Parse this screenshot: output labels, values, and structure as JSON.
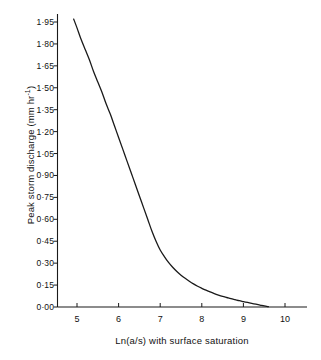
{
  "chart_data": {
    "type": "line",
    "title": "",
    "subtitle": "",
    "xlabel": "Ln(a/s) with surface saturation",
    "ylabel_text": "Peak storm discharge (mm hr",
    "ylabel_exponent": "-1",
    "ylabel_tail": ")",
    "ylabel_full": "Peak storm discharge (mm hr^-1)",
    "xlim": [
      4.55,
      10.45
    ],
    "ylim": [
      0.0,
      2.0
    ],
    "grid": false,
    "legend": null,
    "annotations": [],
    "xticks": [
      5,
      6,
      7,
      8,
      9,
      10
    ],
    "xtick_labels": [
      "5",
      "6",
      "7",
      "8",
      "9",
      "10"
    ],
    "yticks": [
      0.0,
      0.15,
      0.3,
      0.45,
      0.6,
      0.75,
      0.9,
      1.05,
      1.2,
      1.35,
      1.5,
      1.65,
      1.8,
      1.95
    ],
    "ytick_labels": [
      "0·00",
      "0·15",
      "0·30",
      "0·45",
      "0·60",
      "0·75",
      "0·90",
      "1·05",
      "1·20",
      "1·35",
      "1·50",
      "1·65",
      "1·80",
      "1·95"
    ],
    "series": [
      {
        "name": "Peak storm discharge",
        "color": "#1a1a1a",
        "linewidth": 1.3,
        "x": [
          4.92,
          5.0,
          5.1,
          5.2,
          5.3,
          5.4,
          5.5,
          5.6,
          5.7,
          5.8,
          5.9,
          6.0,
          6.1,
          6.2,
          6.3,
          6.4,
          6.5,
          6.6,
          6.7,
          6.8,
          6.9,
          7.0,
          7.1,
          7.2,
          7.3,
          7.4,
          7.5,
          7.6,
          7.7,
          7.8,
          7.9,
          8.0,
          8.1,
          8.2,
          8.3,
          8.4,
          8.5,
          8.6,
          8.7,
          8.8,
          8.9,
          9.0,
          9.1,
          9.2,
          9.3,
          9.4,
          9.5,
          9.6
        ],
        "y": [
          1.97,
          1.91,
          1.83,
          1.76,
          1.69,
          1.61,
          1.54,
          1.47,
          1.39,
          1.32,
          1.24,
          1.16,
          1.08,
          1.0,
          0.92,
          0.84,
          0.76,
          0.68,
          0.6,
          0.52,
          0.45,
          0.39,
          0.345,
          0.305,
          0.272,
          0.243,
          0.218,
          0.196,
          0.176,
          0.158,
          0.142,
          0.128,
          0.115,
          0.103,
          0.092,
          0.082,
          0.073,
          0.065,
          0.057,
          0.05,
          0.043,
          0.037,
          0.031,
          0.025,
          0.019,
          0.013,
          0.007,
          0.002
        ]
      }
    ]
  },
  "figure": {
    "background_color": "#ffffff",
    "axis_color": "#1a1a1a",
    "text_color": "#111111"
  }
}
